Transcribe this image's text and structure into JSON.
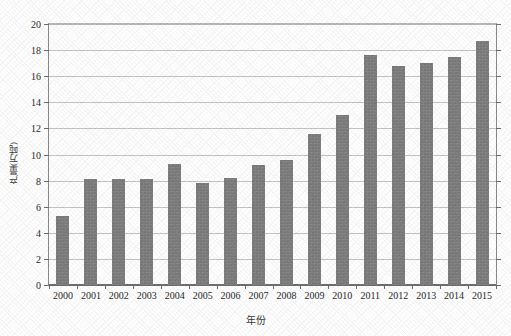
{
  "chart_data": {
    "type": "bar",
    "title": "",
    "xlabel": "年份",
    "ylabel": "产量(万吨)",
    "categories": [
      "2000",
      "2001",
      "2002",
      "2003",
      "2004",
      "2005",
      "2006",
      "2007",
      "2008",
      "2009",
      "2010",
      "2011",
      "2012",
      "2013",
      "2014",
      "2015"
    ],
    "values": [
      5.3,
      8.1,
      8.1,
      8.1,
      9.3,
      7.8,
      8.2,
      9.2,
      9.6,
      11.6,
      13.0,
      17.6,
      16.8,
      17.0,
      17.5,
      18.7
    ],
    "series": [
      {
        "name": "产量",
        "values": [
          5.3,
          8.1,
          8.1,
          8.1,
          9.3,
          7.8,
          8.2,
          9.2,
          9.6,
          11.6,
          13.0,
          17.6,
          16.8,
          17.0,
          17.5,
          18.7
        ]
      }
    ],
    "ylim": [
      0,
      20
    ],
    "yticks": [
      0,
      2,
      4,
      6,
      8,
      10,
      12,
      14,
      16,
      18,
      20
    ],
    "ytick_labels": [
      "0",
      "2",
      "4",
      "6",
      "8",
      "10",
      "12",
      "14",
      "16",
      "18",
      "20"
    ],
    "grid": true,
    "grid_axis": "y",
    "legend": false,
    "legend_position": "none",
    "bar_color": "#7e7e7e",
    "grid_color": "#c4c4c4",
    "axis_color": "#6f6f6f",
    "background_color": "#ffffff"
  }
}
